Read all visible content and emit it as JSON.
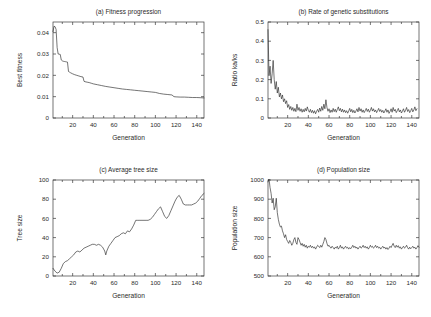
{
  "figure": {
    "background_color": "#ffffff",
    "line_color": "#2a2a2a",
    "axis_color": "#3a3a3a"
  },
  "chart_data": [
    {
      "id": "a",
      "type": "line",
      "title": "(a) Fitness progression",
      "xlabel": "Generation",
      "ylabel": "Best fitness",
      "xlim": [
        1,
        147
      ],
      "ylim": [
        0,
        0.045
      ],
      "xticks": [
        20,
        40,
        60,
        80,
        100,
        120,
        140
      ],
      "xticklabels": [
        "20",
        "40",
        "60",
        "80",
        "100",
        "120",
        "140"
      ],
      "yticks": [
        0,
        0.01,
        0.02,
        0.03,
        0.04
      ],
      "yticklabels": [
        "0",
        "0.01",
        "0.02",
        "0.03",
        "0.04"
      ],
      "grid": false,
      "legend": "none",
      "x": [
        1,
        2,
        3,
        4,
        5,
        6,
        7,
        8,
        9,
        10,
        11,
        12,
        13,
        14,
        15,
        16,
        17,
        18,
        20,
        22,
        24,
        26,
        28,
        30,
        31,
        32,
        34,
        36,
        38,
        40,
        44,
        48,
        52,
        56,
        60,
        64,
        68,
        72,
        76,
        80,
        84,
        88,
        92,
        96,
        100,
        104,
        108,
        112,
        116,
        118,
        120,
        124,
        128,
        132,
        136,
        140,
        144,
        147
      ],
      "y": [
        0.0405,
        0.043,
        0.0428,
        0.0415,
        0.033,
        0.03,
        0.0299,
        0.0298,
        0.0272,
        0.0268,
        0.0266,
        0.0265,
        0.0264,
        0.0263,
        0.0262,
        0.0218,
        0.0215,
        0.0212,
        0.0207,
        0.0203,
        0.02,
        0.0197,
        0.0194,
        0.0192,
        0.0172,
        0.017,
        0.0168,
        0.0166,
        0.0163,
        0.016,
        0.0156,
        0.0152,
        0.0148,
        0.0145,
        0.0142,
        0.0139,
        0.0136,
        0.0134,
        0.0132,
        0.013,
        0.0128,
        0.0126,
        0.0124,
        0.0122,
        0.012,
        0.0115,
        0.0112,
        0.011,
        0.0108,
        0.01,
        0.0099,
        0.0098,
        0.0098,
        0.0097,
        0.0096,
        0.0096,
        0.0095,
        0.0094
      ]
    },
    {
      "id": "b",
      "type": "line",
      "title": "(b) Rate of genetic substitutions",
      "xlabel": "Generation",
      "ylabel": "Ratio ka/ks",
      "xlim": [
        1,
        147
      ],
      "ylim": [
        0,
        0.5
      ],
      "xticks": [
        20,
        40,
        60,
        80,
        100,
        120,
        140
      ],
      "xticklabels": [
        "20",
        "40",
        "60",
        "80",
        "100",
        "120",
        "140"
      ],
      "yticks": [
        0,
        0.1,
        0.2,
        0.3,
        0.4,
        0.5
      ],
      "yticklabels": [
        "0",
        "0.1",
        "0.2",
        "0.3",
        "0.4",
        "0.5"
      ],
      "grid": false,
      "legend": "none",
      "x": [
        1,
        2,
        3,
        4,
        5,
        6,
        7,
        8,
        9,
        10,
        11,
        12,
        13,
        14,
        15,
        16,
        17,
        18,
        19,
        20,
        21,
        22,
        23,
        24,
        25,
        26,
        27,
        28,
        29,
        30,
        31,
        32,
        33,
        34,
        35,
        36,
        37,
        38,
        39,
        40,
        41,
        42,
        43,
        44,
        45,
        46,
        47,
        48,
        49,
        50,
        51,
        52,
        53,
        54,
        55,
        56,
        57,
        58,
        59,
        60,
        61,
        62,
        63,
        64,
        65,
        66,
        67,
        68,
        69,
        70,
        71,
        72,
        73,
        74,
        75,
        76,
        77,
        78,
        79,
        80,
        81,
        82,
        83,
        84,
        85,
        86,
        87,
        88,
        89,
        90,
        91,
        92,
        93,
        94,
        95,
        96,
        97,
        98,
        99,
        100,
        101,
        102,
        103,
        104,
        105,
        106,
        107,
        108,
        109,
        110,
        111,
        112,
        113,
        114,
        115,
        116,
        117,
        118,
        119,
        120,
        121,
        122,
        123,
        124,
        125,
        126,
        127,
        128,
        129,
        130,
        131,
        132,
        133,
        134,
        135,
        136,
        137,
        138,
        139,
        140,
        141,
        142,
        143,
        144,
        145,
        146,
        147
      ],
      "y": [
        0.46,
        0.22,
        0.27,
        0.18,
        0.23,
        0.3,
        0.2,
        0.15,
        0.19,
        0.13,
        0.16,
        0.11,
        0.13,
        0.1,
        0.12,
        0.085,
        0.1,
        0.075,
        0.09,
        0.055,
        0.07,
        0.045,
        0.06,
        0.04,
        0.055,
        0.035,
        0.05,
        0.033,
        0.072,
        0.04,
        0.055,
        0.035,
        0.048,
        0.03,
        0.045,
        0.032,
        0.05,
        0.036,
        0.058,
        0.04,
        0.03,
        0.045,
        0.028,
        0.04,
        0.025,
        0.038,
        0.022,
        0.035,
        0.045,
        0.03,
        0.052,
        0.035,
        0.06,
        0.04,
        0.072,
        0.048,
        0.095,
        0.055,
        0.035,
        0.048,
        0.028,
        0.042,
        0.03,
        0.05,
        0.033,
        0.046,
        0.03,
        0.044,
        0.058,
        0.038,
        0.05,
        0.032,
        0.046,
        0.03,
        0.042,
        0.028,
        0.038,
        0.025,
        0.036,
        0.05,
        0.032,
        0.045,
        0.028,
        0.04,
        0.026,
        0.036,
        0.048,
        0.032,
        0.055,
        0.036,
        0.048,
        0.03,
        0.042,
        0.028,
        0.038,
        0.05,
        0.034,
        0.046,
        0.03,
        0.04,
        0.055,
        0.036,
        0.048,
        0.032,
        0.042,
        0.028,
        0.038,
        0.05,
        0.034,
        0.044,
        0.03,
        0.04,
        0.026,
        0.036,
        0.048,
        0.03,
        0.042,
        0.024,
        0.034,
        0.048,
        0.03,
        0.055,
        0.036,
        0.045,
        0.028,
        0.038,
        0.05,
        0.032,
        0.042,
        0.026,
        0.036,
        0.048,
        0.03,
        0.04,
        0.055,
        0.034,
        0.044,
        0.028,
        0.038,
        0.05,
        0.032,
        0.042,
        0.058,
        0.038,
        0.048
      ]
    },
    {
      "id": "c",
      "type": "line",
      "title": "(c) Average tree size",
      "xlabel": "Generation",
      "ylabel": "Tree size",
      "xlim": [
        1,
        147
      ],
      "ylim": [
        0,
        100
      ],
      "xticks": [
        20,
        40,
        60,
        80,
        100,
        120,
        140
      ],
      "xticklabels": [
        "20",
        "40",
        "60",
        "80",
        "100",
        "120",
        "140"
      ],
      "yticks": [
        0,
        20,
        40,
        60,
        80,
        100
      ],
      "yticklabels": [
        "0",
        "20",
        "40",
        "60",
        "80",
        "100"
      ],
      "grid": false,
      "legend": "none",
      "x": [
        1,
        3,
        5,
        7,
        9,
        11,
        13,
        15,
        17,
        19,
        21,
        23,
        25,
        27,
        29,
        31,
        33,
        35,
        37,
        39,
        41,
        43,
        45,
        47,
        49,
        51,
        52,
        53,
        55,
        57,
        59,
        61,
        63,
        65,
        67,
        69,
        71,
        73,
        75,
        77,
        79,
        81,
        83,
        85,
        87,
        89,
        91,
        93,
        95,
        97,
        99,
        101,
        103,
        105,
        107,
        109,
        111,
        113,
        115,
        117,
        119,
        121,
        123,
        125,
        127,
        129,
        131,
        133,
        135,
        137,
        139,
        141,
        143,
        145,
        147
      ],
      "y": [
        8,
        5,
        3,
        4,
        8,
        13,
        15,
        16,
        18,
        20,
        22,
        25,
        26,
        25,
        27,
        29,
        30,
        31,
        32,
        33,
        33,
        32,
        33,
        32,
        30,
        26,
        22,
        26,
        31,
        34,
        37,
        40,
        41,
        42,
        44,
        45,
        44,
        47,
        46,
        49,
        53,
        58,
        58,
        58,
        58,
        58,
        58,
        58,
        59,
        61,
        64,
        67,
        70,
        72,
        67,
        62,
        60,
        63,
        68,
        73,
        78,
        82,
        84,
        80,
        75,
        74,
        74,
        74,
        74,
        75,
        76,
        78,
        81,
        84,
        86
      ]
    },
    {
      "id": "d",
      "type": "line",
      "title": "(d) Population size",
      "xlabel": "Generation",
      "ylabel": "Population size",
      "xlim": [
        1,
        147
      ],
      "ylim": [
        500,
        1000
      ],
      "xticks": [
        20,
        40,
        60,
        80,
        100,
        120,
        140
      ],
      "xticklabels": [
        "20",
        "40",
        "60",
        "80",
        "100",
        "120",
        "140"
      ],
      "yticks": [
        500,
        600,
        700,
        800,
        900,
        1000
      ],
      "yticklabels": [
        "500",
        "600",
        "700",
        "800",
        "900",
        "1000"
      ],
      "grid": false,
      "legend": "none",
      "x": [
        1,
        2,
        3,
        4,
        5,
        6,
        7,
        8,
        9,
        10,
        11,
        12,
        13,
        14,
        15,
        16,
        17,
        18,
        19,
        20,
        21,
        22,
        23,
        24,
        25,
        26,
        27,
        28,
        29,
        30,
        31,
        32,
        33,
        34,
        35,
        36,
        37,
        38,
        39,
        40,
        41,
        42,
        43,
        44,
        45,
        46,
        47,
        48,
        49,
        50,
        51,
        52,
        53,
        54,
        55,
        56,
        57,
        58,
        59,
        60,
        61,
        62,
        63,
        64,
        65,
        66,
        67,
        68,
        69,
        70,
        71,
        72,
        73,
        74,
        75,
        76,
        77,
        78,
        79,
        80,
        81,
        82,
        83,
        84,
        85,
        86,
        87,
        88,
        89,
        90,
        91,
        92,
        93,
        94,
        95,
        96,
        97,
        98,
        99,
        100,
        101,
        102,
        103,
        104,
        105,
        106,
        107,
        108,
        109,
        110,
        111,
        112,
        113,
        114,
        115,
        116,
        117,
        118,
        119,
        120,
        121,
        122,
        123,
        124,
        125,
        126,
        127,
        128,
        129,
        130,
        131,
        132,
        133,
        134,
        135,
        136,
        137,
        138,
        139,
        140,
        141,
        142,
        143,
        144,
        145,
        146,
        147
      ],
      "y": [
        990,
        1005,
        960,
        930,
        880,
        905,
        845,
        860,
        905,
        830,
        795,
        770,
        755,
        760,
        735,
        720,
        700,
        715,
        690,
        680,
        670,
        685,
        675,
        660,
        670,
        690,
        700,
        675,
        665,
        700,
        690,
        675,
        660,
        670,
        655,
        665,
        650,
        660,
        645,
        655,
        650,
        660,
        648,
        655,
        645,
        652,
        640,
        650,
        660,
        655,
        648,
        660,
        650,
        665,
        680,
        700,
        690,
        670,
        655,
        660,
        650,
        645,
        655,
        648,
        640,
        650,
        645,
        655,
        640,
        648,
        660,
        645,
        652,
        640,
        648,
        655,
        645,
        650,
        640,
        648,
        642,
        650,
        660,
        648,
        655,
        645,
        650,
        640,
        648,
        655,
        645,
        650,
        660,
        648,
        655,
        645,
        652,
        640,
        648,
        660,
        650,
        655,
        645,
        650,
        660,
        648,
        655,
        645,
        650,
        640,
        648,
        655,
        645,
        650,
        640,
        648,
        638,
        645,
        655,
        648,
        660,
        670,
        655,
        648,
        660,
        650,
        658,
        645,
        652,
        640,
        648,
        655,
        645,
        650,
        660,
        648,
        640,
        650,
        642,
        648,
        655,
        645,
        650,
        640,
        648,
        658,
        650
      ]
    }
  ]
}
